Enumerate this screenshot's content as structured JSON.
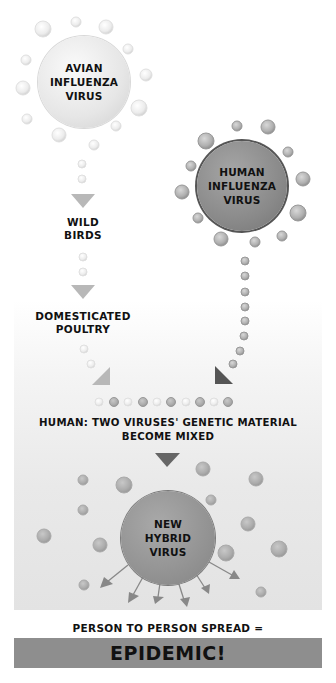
{
  "diagram": {
    "nodes": {
      "avian": {
        "lines": [
          "AVIAN",
          "INFLUENZA",
          "VIRUS"
        ]
      },
      "wild_birds": {
        "lines": [
          "WILD",
          "BIRDS"
        ]
      },
      "domesticated_poultry": {
        "lines": [
          "DOMESTICATED",
          "POULTRY"
        ]
      },
      "human_virus": {
        "lines": [
          "HUMAN",
          "INFLUENZA",
          "VIRUS"
        ]
      },
      "mixing": {
        "lines": [
          "HUMAN: TWO VIRUSES' GENETIC MATERIAL",
          "BECOME MIXED"
        ]
      },
      "hybrid": {
        "lines": [
          "NEW",
          "HYBRID",
          "VIRUS"
        ]
      },
      "spread": {
        "text": "PERSON TO PERSON SPREAD ="
      },
      "result": {
        "text": "EPIDEMIC!"
      }
    },
    "flow": [
      "AVIAN INFLUENZA VIRUS -> WILD BIRDS",
      "WILD BIRDS -> DOMESTICATED POULTRY",
      "DOMESTICATED POULTRY -> HUMAN",
      "HUMAN INFLUENZA VIRUS -> HUMAN",
      "HUMAN -> NEW HYBRID VIRUS",
      "NEW HYBRID VIRUS -> PERSON TO PERSON SPREAD = EPIDEMIC!"
    ],
    "colors": {
      "avian_fill": "#e6e6e6",
      "human_fill": "#8a8a8a",
      "hybrid_fill": "#939393",
      "banner": "#8e8e8e",
      "light_arrow": "#b8b8b8",
      "dark_arrow": "#555555",
      "text": "#111111"
    }
  }
}
